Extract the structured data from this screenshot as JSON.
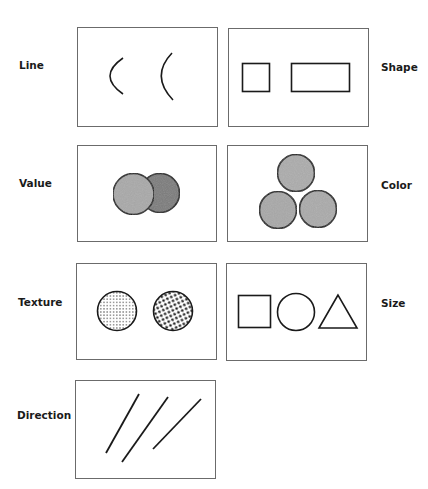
{
  "diagram": {
    "panels": [
      {
        "id": "line",
        "label": "Line",
        "label_side": "left",
        "content": "two curved arcs of different curvature"
      },
      {
        "id": "shape",
        "label": "Shape",
        "label_side": "right",
        "content": "square and rectangle outlines"
      },
      {
        "id": "value",
        "label": "Value",
        "label_side": "left",
        "content": "two overlapping circles, light and dark gray"
      },
      {
        "id": "color",
        "label": "Color",
        "label_side": "right",
        "content": "three gray circles arranged in a triangle"
      },
      {
        "id": "texture",
        "label": "Texture",
        "label_side": "left",
        "content": "two circles with fine and coarse dot stipple"
      },
      {
        "id": "size",
        "label": "Size",
        "label_side": "right",
        "content": "square, circle and triangle outlines"
      },
      {
        "id": "direction",
        "label": "Direction",
        "label_side": "left",
        "content": "three diagonal lines at different angles"
      }
    ],
    "colors": {
      "stroke": "#1a1a1a",
      "frame": "#6b6b6b",
      "value_light": "#a9a9a9",
      "value_dark": "#7b7b7b",
      "color_fill": "#acacac"
    }
  }
}
